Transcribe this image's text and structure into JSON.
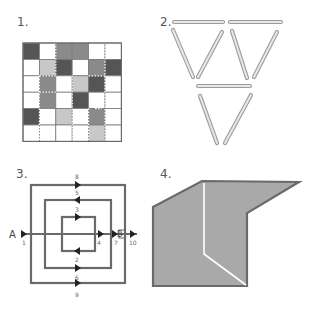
{
  "puzzles": [
    {
      "number": "1.",
      "type": "grid"
    },
    {
      "number": "2.",
      "type": "matchsticks"
    },
    {
      "number": "3.",
      "type": "concentric-squares-path"
    },
    {
      "number": "4.",
      "type": "folded-shape"
    }
  ],
  "grid": {
    "rows": 6,
    "cols": 6,
    "colors": {
      "D": "#555555",
      "M": "#8a8a8a",
      "L": "#c8c8c8",
      "W": "#ffffff"
    },
    "cells": [
      [
        "D",
        "W",
        "M",
        "M",
        "W",
        "W"
      ],
      [
        "W",
        "L",
        "D",
        "W",
        "M",
        "D"
      ],
      [
        "W",
        "M",
        "W",
        "L",
        "D",
        "W"
      ],
      [
        "W",
        "M",
        "W",
        "D",
        "W",
        "W"
      ],
      [
        "D",
        "W",
        "L",
        "W",
        "M",
        "W"
      ],
      [
        "W",
        "W",
        "W",
        "W",
        "L",
        "W"
      ]
    ]
  },
  "matchsticks": {
    "count": 9,
    "color": "#bdbdbd"
  },
  "path_diagram": {
    "start_label": "A",
    "end_label": "B",
    "labels": [
      "1",
      "2",
      "3",
      "4",
      "5",
      "6",
      "7",
      "8",
      "9",
      "10"
    ]
  },
  "folded_shape": {
    "fill": "#a9a9a9",
    "stroke": "#6a6a6a",
    "fold_line": "#ffffff"
  }
}
